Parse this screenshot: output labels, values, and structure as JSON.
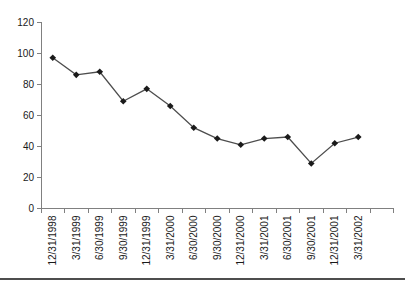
{
  "chart_data": {
    "type": "line",
    "title": "",
    "xlabel": "",
    "ylabel": "",
    "categories": [
      "12/31/1998",
      "3/31/1999",
      "6/30/1999",
      "9/30/1999",
      "12/31/1999",
      "3/31/2000",
      "6/30/2000",
      "9/30/2000",
      "12/31/2000",
      "3/31/2001",
      "6/30/2001",
      "9/30/2001",
      "12/31/2001",
      "3/31/2002"
    ],
    "values": [
      97,
      86,
      88,
      69,
      77,
      66,
      52,
      45,
      41,
      45,
      46,
      29,
      42,
      46
    ],
    "ylim": [
      0,
      120
    ],
    "ytick_step": 20,
    "yticks": [
      0,
      20,
      40,
      60,
      80,
      100,
      120
    ],
    "grid": false,
    "legend": "none",
    "marker": "diamond",
    "extra_empty_slots": 1,
    "colors": {
      "line": "#4d4d4d",
      "marker": "#1a1a1a",
      "axis": "#808080",
      "tick_label": "#1a1a1a"
    }
  },
  "page": {
    "background": "#ffffff",
    "bottom_rule_color": "#4d4d4d"
  }
}
